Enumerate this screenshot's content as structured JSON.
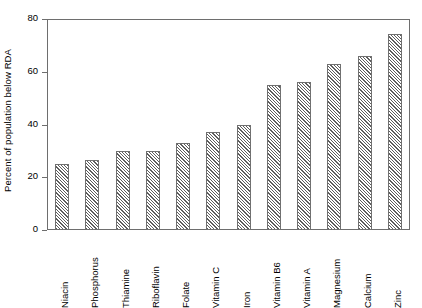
{
  "chart_data": {
    "type": "bar",
    "title": "",
    "xlabel": "",
    "ylabel": "Percent of population below RDA",
    "categories": [
      "Niacin",
      "Phosphorus",
      "Thiamine",
      "Riboflavin",
      "Folate",
      "Vitamin C",
      "Iron",
      "Vitamin B6",
      "Vitamin A",
      "Magnesium",
      "Calcium",
      "Zinc"
    ],
    "values": [
      25,
      26.5,
      30,
      30,
      33,
      37,
      40,
      55,
      56,
      63,
      66,
      74.5
    ],
    "ylim": [
      0,
      80
    ],
    "yticks": [
      0,
      20,
      40,
      60,
      80
    ],
    "ytick_labels": [
      "0",
      "20",
      "40",
      "60",
      "80"
    ],
    "grid": false,
    "legend": false,
    "bar_fill": "diagonal-hatch",
    "bar_edge_color": "#707070",
    "axis_color": "#6e6e6e",
    "background": "#ffffff",
    "xtick_rotation": 90
  }
}
